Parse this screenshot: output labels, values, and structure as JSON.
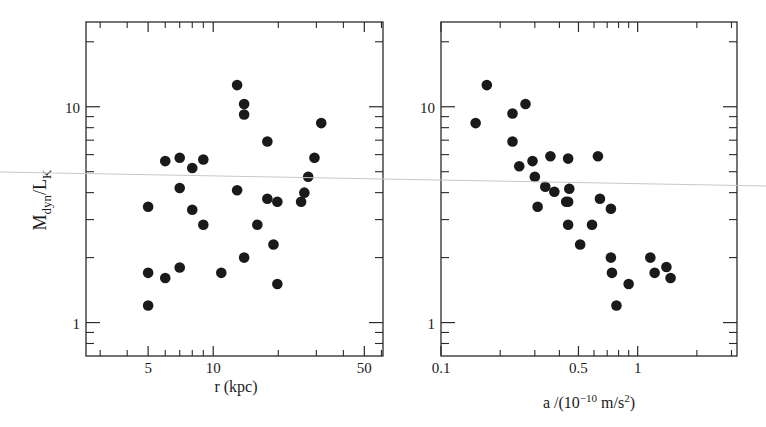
{
  "figure": {
    "y_label_main": "M",
    "y_label_sub1": "dyn",
    "y_label_slash": "/L",
    "y_label_sub2": "K"
  },
  "chart_data": [
    {
      "type": "scatter",
      "title": "",
      "xlabel": "r (kpc)",
      "ylabel": "M_dyn/L_K",
      "xscale": "log",
      "yscale": "log",
      "xlim": [
        2.58,
        61
      ],
      "ylim": [
        0.7,
        24.7
      ],
      "x_ticklabels": [
        "5",
        "10",
        "50"
      ],
      "x_major_ticks": [
        5,
        10,
        50
      ],
      "x_minor_ticks": [
        3,
        4,
        6,
        7,
        8,
        9,
        20,
        30,
        40,
        60
      ],
      "y_ticklabels": [
        "1",
        "10"
      ],
      "y_major_ticks": [
        1,
        10
      ],
      "y_minor_ticks": [
        0.8,
        0.9,
        2,
        3,
        4,
        5,
        6,
        7,
        8,
        9,
        20
      ],
      "grid": false,
      "legend": null,
      "marker": "filled circle",
      "color": "#1a1a1a",
      "points": [
        [
          5.0,
          3.44
        ],
        [
          5.0,
          1.7
        ],
        [
          5.0,
          1.2
        ],
        [
          6.0,
          5.6
        ],
        [
          6.0,
          1.61
        ],
        [
          7.0,
          5.8
        ],
        [
          7.0,
          4.2
        ],
        [
          7.0,
          1.8
        ],
        [
          8.0,
          5.2
        ],
        [
          8.0,
          3.33
        ],
        [
          9.0,
          5.7
        ],
        [
          9.0,
          2.84
        ],
        [
          10.9,
          1.7
        ],
        [
          12.9,
          12.6
        ],
        [
          12.9,
          4.1
        ],
        [
          13.9,
          10.3
        ],
        [
          13.9,
          9.2
        ],
        [
          13.9,
          2.0
        ],
        [
          16.0,
          2.84
        ],
        [
          17.8,
          6.9
        ],
        [
          17.8,
          3.75
        ],
        [
          19.0,
          2.3
        ],
        [
          19.8,
          3.63
        ],
        [
          19.8,
          1.51
        ],
        [
          25.5,
          3.63
        ],
        [
          26.4,
          4.0
        ],
        [
          27.5,
          4.74
        ],
        [
          29.4,
          5.8
        ],
        [
          31.6,
          8.4
        ]
      ]
    },
    {
      "type": "scatter",
      "title": "",
      "xlabel": "a/(10^-10 m/s^2)",
      "xlabel_parts": {
        "pre": "a /(10",
        "exp1": "−10",
        "mid": " m/s",
        "exp2": "2",
        "post": ")"
      },
      "ylabel": "",
      "xscale": "log",
      "yscale": "log",
      "xlim": [
        0.1,
        3.2
      ],
      "ylim": [
        0.7,
        24.7
      ],
      "x_ticklabels": [
        "0.1",
        "0.5",
        "1"
      ],
      "x_major_ticks": [
        0.1,
        0.5,
        1
      ],
      "x_minor_ticks": [
        0.2,
        0.3,
        0.4,
        0.6,
        0.7,
        0.8,
        0.9,
        2,
        3
      ],
      "y_ticklabels": [
        "1",
        "10"
      ],
      "y_major_ticks": [
        1,
        10
      ],
      "y_minor_ticks": [
        0.8,
        0.9,
        2,
        3,
        4,
        5,
        6,
        7,
        8,
        9,
        20
      ],
      "grid": false,
      "legend": null,
      "marker": "filled circle",
      "color": "#1a1a1a",
      "points": [
        [
          0.15,
          8.4
        ],
        [
          0.171,
          12.6
        ],
        [
          0.231,
          9.3
        ],
        [
          0.231,
          6.9
        ],
        [
          0.269,
          10.3
        ],
        [
          0.25,
          5.3
        ],
        [
          0.292,
          5.6
        ],
        [
          0.3,
          4.74
        ],
        [
          0.31,
          3.44
        ],
        [
          0.339,
          4.26
        ],
        [
          0.36,
          5.9
        ],
        [
          0.377,
          4.04
        ],
        [
          0.433,
          3.63
        ],
        [
          0.443,
          5.75
        ],
        [
          0.443,
          3.63
        ],
        [
          0.449,
          4.17
        ],
        [
          0.443,
          2.84
        ],
        [
          0.51,
          2.3
        ],
        [
          0.586,
          2.84
        ],
        [
          0.628,
          5.9
        ],
        [
          0.643,
          3.75
        ],
        [
          0.731,
          3.37
        ],
        [
          0.731,
          2.0
        ],
        [
          0.74,
          1.7
        ],
        [
          0.78,
          1.2
        ],
        [
          0.9,
          1.51
        ],
        [
          1.16,
          2.0
        ],
        [
          1.22,
          1.7
        ],
        [
          1.4,
          1.81
        ],
        [
          1.47,
          1.61
        ]
      ]
    }
  ]
}
